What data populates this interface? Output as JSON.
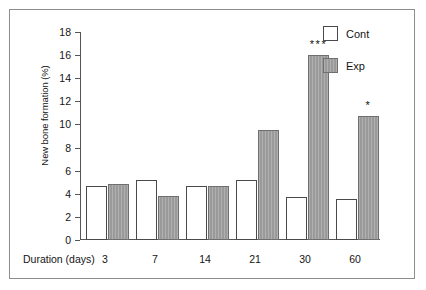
{
  "chart_data": {
    "type": "bar",
    "title": "",
    "xlabel": "Duration (days)",
    "ylabel": "New bone formation (%)",
    "categories": [
      "3",
      "7",
      "14",
      "21",
      "30",
      "60"
    ],
    "ylim": [
      0,
      18
    ],
    "yticks": [
      0,
      2,
      4,
      6,
      8,
      10,
      12,
      14,
      16,
      18
    ],
    "grid": false,
    "legend_position": "top-right",
    "series": [
      {
        "name": "Cont",
        "color": "#ffffff",
        "values": [
          4.65,
          5.2,
          4.65,
          5.2,
          3.75,
          3.55
        ]
      },
      {
        "name": "Exp",
        "color": "#9a9a9a",
        "values": [
          4.85,
          3.85,
          4.65,
          9.5,
          16.05,
          10.7
        ]
      }
    ],
    "annotations": [
      {
        "category": "30",
        "series": "Exp",
        "text": "***"
      },
      {
        "category": "60",
        "series": "Exp",
        "text": "*"
      }
    ]
  },
  "legend": {
    "items": [
      {
        "label": "Cont"
      },
      {
        "label": "Exp"
      }
    ]
  }
}
